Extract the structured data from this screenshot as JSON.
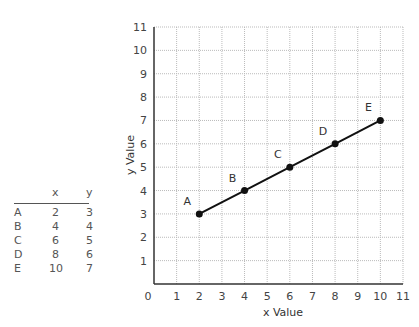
{
  "table": {
    "headers": [
      "",
      "x",
      "y"
    ],
    "rows": [
      [
        "A",
        "2",
        "3"
      ],
      [
        "B",
        "4",
        "4"
      ],
      [
        "C",
        "6",
        "5"
      ],
      [
        "D",
        "8",
        "6"
      ],
      [
        "E",
        "10",
        "7"
      ]
    ]
  },
  "chart_data": {
    "type": "line",
    "title": "",
    "xlabel": "x Value",
    "ylabel": "y Value",
    "xlim": [
      0,
      11
    ],
    "ylim": [
      0,
      11
    ],
    "grid": true,
    "x_ticks": [
      "0",
      "1",
      "2",
      "3",
      "4",
      "5",
      "6",
      "7",
      "8",
      "9",
      "10",
      "11"
    ],
    "y_ticks": [
      "1",
      "2",
      "3",
      "4",
      "5",
      "6",
      "7",
      "8",
      "9",
      "10",
      "11"
    ],
    "points": [
      {
        "label": "A",
        "x": 2,
        "y": 3
      },
      {
        "label": "B",
        "x": 4,
        "y": 4
      },
      {
        "label": "C",
        "x": 6,
        "y": 5
      },
      {
        "label": "D",
        "x": 8,
        "y": 6
      },
      {
        "label": "E",
        "x": 10,
        "y": 7
      }
    ],
    "line_color": "#111111",
    "grid_color": "#bbbbbb"
  }
}
